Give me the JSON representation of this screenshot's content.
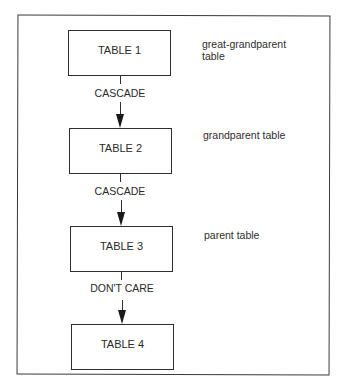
{
  "diagram": {
    "type": "vertical-chain",
    "colors": {
      "line": "#2e2e2e",
      "text": "#2a2a2a",
      "background": "#ffffff"
    },
    "tables": [
      {
        "label": "TABLE 1",
        "role": "great-grandparent table",
        "role_lines": [
          "great-grandparent",
          "table"
        ]
      },
      {
        "label": "TABLE 2",
        "role": "grandparent table",
        "role_lines": [
          "grandparent table"
        ]
      },
      {
        "label": "TABLE 3",
        "role": "parent table",
        "role_lines": [
          "parent table"
        ]
      },
      {
        "label": "TABLE 4",
        "role": "",
        "role_lines": []
      }
    ],
    "relationships": [
      {
        "from": "TABLE 1",
        "to": "TABLE 2",
        "label": "CASCADE"
      },
      {
        "from": "TABLE 2",
        "to": "TABLE 3",
        "label": "CASCADE"
      },
      {
        "from": "TABLE 3",
        "to": "TABLE 4",
        "label": "DON'T CARE"
      }
    ]
  }
}
